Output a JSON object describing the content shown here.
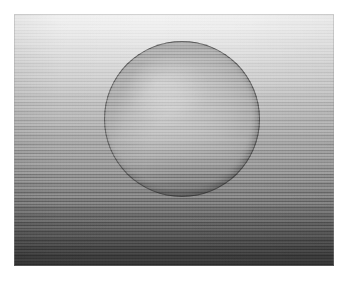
{
  "image": {
    "title": "Shaded sphere on graduated backdrop",
    "subject": "sphere",
    "scene_description": "A smooth matte grey sphere photographed against a vertically graduated studio backdrop that fades from near-white at the top to dark grey at the bottom.",
    "color_mode": "grayscale",
    "canvas": {
      "width_px": 356,
      "height_px": 283,
      "margin_color": "#ffffff"
    },
    "content_frame": {
      "left_px": 14,
      "top_px": 14,
      "width_px": 320,
      "height_px": 252
    },
    "background": {
      "name": "graduated-backdrop",
      "type": "vertical-gradient",
      "direction": "top-to-bottom",
      "top_color": "#f3f3f3",
      "mid_color": "#a6a6a6",
      "bottom_color": "#333333"
    },
    "sphere": {
      "name": "sphere",
      "center_x_px": 182,
      "center_y_px": 119,
      "diameter_px": 156,
      "body_color": "#b4b4b4",
      "highlight_color": "#cfcfcf",
      "terminator_color": "#6a6a6a",
      "rim_color": "#2a2a2a",
      "light_direction": "upper-left",
      "shading": "matte / diffuse"
    },
    "texture": {
      "name": "film-grain",
      "type": "scan-noise",
      "visible": true
    }
  }
}
